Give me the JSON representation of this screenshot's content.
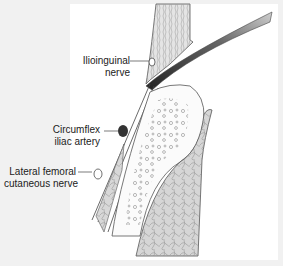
{
  "figure": {
    "labels": {
      "ilioinguinal": [
        "Ilioinguinal",
        "nerve"
      ],
      "circumflex": [
        "Circumflex",
        "iliac artery"
      ],
      "lateral_femoral": [
        "Lateral femoral",
        "cutaneous nerve"
      ]
    },
    "colors": {
      "background": "#f1f1f1",
      "panel": "#ffffff",
      "line": "#555555",
      "muscle_fill": "#d8d8d8",
      "artery": "#333333"
    }
  }
}
